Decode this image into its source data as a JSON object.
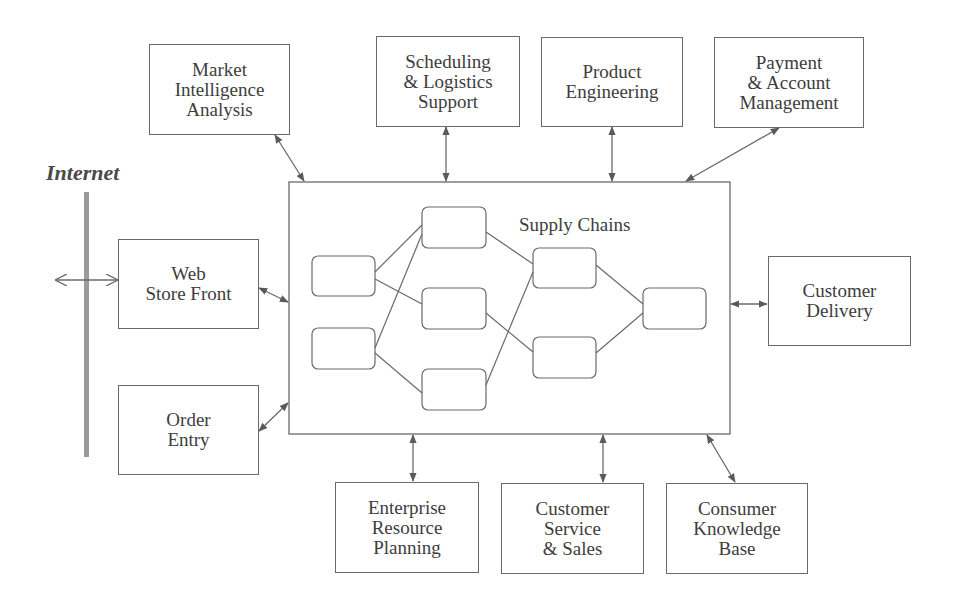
{
  "diagram": {
    "internet_label": "Internet",
    "center": {
      "title": "Supply Chains"
    },
    "top_boxes": [
      {
        "id": "market",
        "label": "Market\nIntelligence\nAnalysis"
      },
      {
        "id": "scheduling",
        "label": "Scheduling\n& Logistics\nSupport"
      },
      {
        "id": "product",
        "label": "Product\nEngineering"
      },
      {
        "id": "payment",
        "label": "Payment\n& Account\nManagement"
      }
    ],
    "left_boxes": [
      {
        "id": "webstore",
        "label": "Web\nStore Front"
      },
      {
        "id": "order",
        "label": "Order\nEntry"
      }
    ],
    "right_boxes": [
      {
        "id": "delivery",
        "label": "Customer\nDelivery"
      }
    ],
    "bottom_boxes": [
      {
        "id": "erp",
        "label": "Enterprise\nResource\nPlanning"
      },
      {
        "id": "service",
        "label": "Customer\nService\n& Sales"
      },
      {
        "id": "knowledge",
        "label": "Consumer\nKnowledge\nBase"
      }
    ],
    "supply_chain_nodes": 8,
    "colors": {
      "line": "#6a6a6a",
      "internet_bar": "#9a9a9a",
      "text": "#3d3d3d"
    }
  }
}
